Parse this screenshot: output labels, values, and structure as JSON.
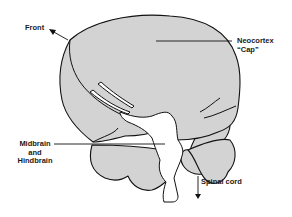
{
  "figure": {
    "colors": {
      "tissue_fill": "#d3d3d3",
      "outline": "#111111",
      "background": "#ffffff"
    }
  },
  "labels": {
    "front": "Front",
    "neocortex_line1": "Neocortex",
    "neocortex_line2": "“Cap”",
    "midbrain_line1": "Midbrain",
    "midbrain_line2": "and",
    "midbrain_line3": "Hindbrain",
    "spinal_cord": "Spinal cord"
  }
}
